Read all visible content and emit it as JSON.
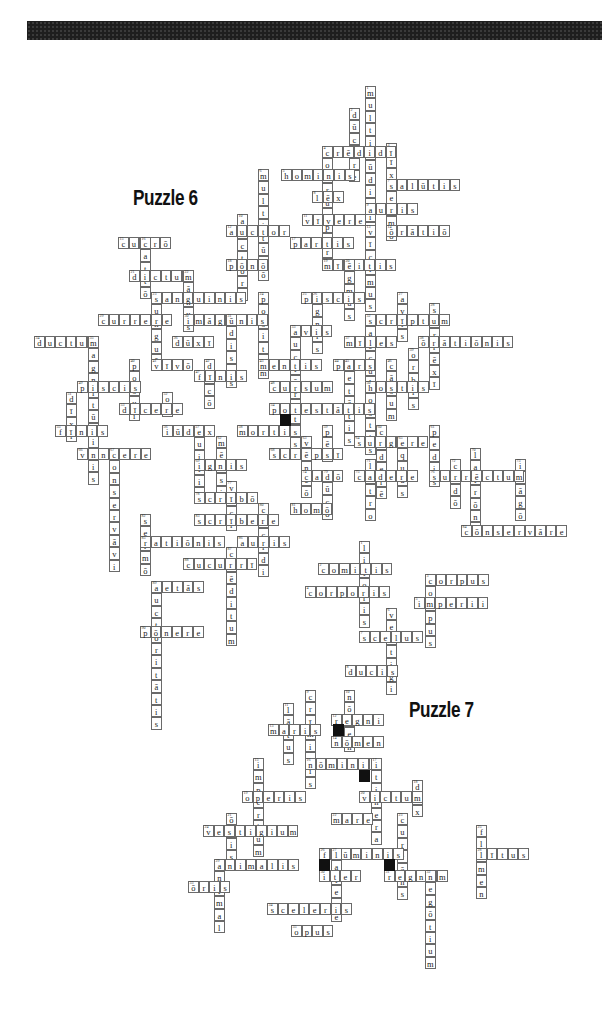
{
  "header": {
    "bar_color": "#1e1e1e"
  },
  "titles": [
    {
      "label": "Puzzle 6",
      "x": 133,
      "y": 185
    },
    {
      "label": "Puzzle 7",
      "x": 409,
      "y": 697
    }
  ],
  "cell": {
    "w": 10.6,
    "h": 12.4
  },
  "puzzle6": {
    "words": [
      {
        "n": "1",
        "x": 365,
        "y": 86,
        "dir": "down",
        "text": "multitūdinis"
      },
      {
        "n": "2",
        "x": 349,
        "y": 108,
        "dir": "down",
        "text": "dūcere"
      },
      {
        "n": "3",
        "x": 386,
        "y": 143,
        "dir": "down",
        "text": "vīxī"
      },
      {
        "n": "4",
        "x": 322,
        "y": 146,
        "dir": "across",
        "text": "crēdidī"
      },
      {
        "n": "4",
        "x": 322,
        "y": 146,
        "dir": "down",
        "text": "corrumpere"
      },
      {
        "n": "5",
        "x": 281,
        "y": 169,
        "dir": "across",
        "text": "hominis"
      },
      {
        "n": "6",
        "x": 258,
        "y": 169,
        "dir": "down",
        "text": "multitūdō"
      },
      {
        "n": "7",
        "x": 386,
        "y": 179,
        "dir": "across",
        "text": "salūtis"
      },
      {
        "n": "7",
        "x": 386,
        "y": 179,
        "dir": "down",
        "text": "sermō"
      },
      {
        "n": "8",
        "x": 312,
        "y": 191,
        "dir": "across",
        "text": "lēx"
      },
      {
        "n": "9",
        "x": 365,
        "y": 203,
        "dir": "across",
        "text": "auris"
      },
      {
        "n": "10",
        "x": 237,
        "y": 214,
        "dir": "down",
        "text": "auctōri"
      },
      {
        "n": "11",
        "x": 302,
        "y": 214,
        "dir": "across",
        "text": "vīvere"
      },
      {
        "n": "12",
        "x": 226,
        "y": 225,
        "dir": "across",
        "text": "auctor"
      },
      {
        "n": "13",
        "x": 365,
        "y": 225,
        "dir": "down",
        "text": "vīcimus"
      },
      {
        "n": "14",
        "x": 386,
        "y": 225,
        "dir": "across",
        "text": "ōrātiō"
      },
      {
        "n": "15",
        "x": 118,
        "y": 237,
        "dir": "across",
        "text": "currō"
      },
      {
        "n": "16",
        "x": 140,
        "y": 237,
        "dir": "down",
        "text": "cattō"
      },
      {
        "n": "17",
        "x": 290,
        "y": 237,
        "dir": "across",
        "text": "partis"
      },
      {
        "n": "18",
        "x": 226,
        "y": 259,
        "dir": "across",
        "text": "pōnō"
      },
      {
        "n": "19",
        "x": 322,
        "y": 259,
        "dir": "across",
        "text": "mīlitis"
      },
      {
        "n": "20",
        "x": 344,
        "y": 259,
        "dir": "down",
        "text": "ēgmus"
      },
      {
        "n": "21",
        "x": 129,
        "y": 270,
        "dir": "across",
        "text": "dictum"
      },
      {
        "n": "22",
        "x": 183,
        "y": 270,
        "dir": "down",
        "text": "mānus"
      },
      {
        "n": "23",
        "x": 151,
        "y": 292,
        "dir": "across",
        "text": "sanguinis"
      },
      {
        "n": "23",
        "x": 151,
        "y": 292,
        "dir": "down",
        "text": "sunguō"
      },
      {
        "n": "24",
        "x": 258,
        "y": 292,
        "dir": "down",
        "text": "positum"
      },
      {
        "n": "25",
        "x": 301,
        "y": 292,
        "dir": "across",
        "text": "piscis"
      },
      {
        "n": "26",
        "x": 312,
        "y": 292,
        "dir": "down",
        "text": "ignis"
      },
      {
        "n": "27",
        "x": 397,
        "y": 292,
        "dir": "down",
        "text": "avis"
      },
      {
        "n": "28",
        "x": 429,
        "y": 303,
        "dir": "down",
        "text": "surrēxī"
      },
      {
        "n": "29",
        "x": 98,
        "y": 314,
        "dir": "across",
        "text": "currere"
      },
      {
        "n": "30",
        "x": 183,
        "y": 314,
        "dir": "across",
        "text": "imāginis"
      },
      {
        "n": "31",
        "x": 226,
        "y": 314,
        "dir": "down",
        "text": "ūdiscs"
      },
      {
        "n": "32",
        "x": 365,
        "y": 314,
        "dir": "across",
        "text": "scrīptum"
      },
      {
        "n": "32",
        "x": 365,
        "y": 314,
        "dir": "down",
        "text": "saeculum"
      },
      {
        "n": "33",
        "x": 290,
        "y": 325,
        "dir": "across",
        "text": "avis"
      },
      {
        "n": "33",
        "x": 290,
        "y": 325,
        "dir": "down",
        "text": "auctōritās"
      },
      {
        "n": "34",
        "x": 34,
        "y": 336,
        "dir": "across",
        "text": "ductum"
      },
      {
        "n": "35",
        "x": 88,
        "y": 336,
        "dir": "down",
        "text": "magnitūdinis"
      },
      {
        "n": "36",
        "x": 172,
        "y": 336,
        "dir": "across",
        "text": "dūxī"
      },
      {
        "n": "37",
        "x": 344,
        "y": 336,
        "dir": "across",
        "text": "mīles"
      },
      {
        "n": "38",
        "x": 418,
        "y": 336,
        "dir": "across",
        "text": "ōrātiōnis"
      },
      {
        "n": "39",
        "x": 408,
        "y": 348,
        "dir": "down",
        "text": "orbis"
      },
      {
        "n": "40",
        "x": 129,
        "y": 359,
        "dir": "down",
        "text": "posui"
      },
      {
        "n": "41",
        "x": 151,
        "y": 359,
        "dir": "across",
        "text": "vīvō"
      },
      {
        "n": "42",
        "x": 204,
        "y": 359,
        "dir": "down",
        "text": "dīcō"
      },
      {
        "n": "43",
        "x": 258,
        "y": 359,
        "dir": "across",
        "text": "mentis"
      },
      {
        "n": "44",
        "x": 333,
        "y": 359,
        "dir": "across",
        "text": "pars"
      },
      {
        "n": "45",
        "x": 344,
        "y": 359,
        "dir": "down",
        "text": "aetātis"
      },
      {
        "n": "46",
        "x": 386,
        "y": 359,
        "dir": "down",
        "text": "cāsum"
      },
      {
        "n": "47",
        "x": 194,
        "y": 370,
        "dir": "across",
        "text": "fīnis"
      },
      {
        "n": "48",
        "x": 269,
        "y": 381,
        "dir": "across",
        "text": "cursum"
      },
      {
        "n": "49",
        "x": 77,
        "y": 381,
        "dir": "across",
        "text": "piscis"
      },
      {
        "n": "50",
        "x": 365,
        "y": 381,
        "dir": "across",
        "text": "hostis"
      },
      {
        "n": "50",
        "x": 365,
        "y": 381,
        "dir": "down",
        "text": "hostis"
      },
      {
        "n": "51",
        "x": 66,
        "y": 392,
        "dir": "down",
        "text": "dīxī"
      },
      {
        "n": "52",
        "x": 162,
        "y": 392,
        "dir": "down",
        "text": "ob"
      },
      {
        "n": "53",
        "x": 119,
        "y": 403,
        "dir": "across",
        "text": "dīcere"
      },
      {
        "n": "54",
        "x": 269,
        "y": 403,
        "dir": "across",
        "text": "potestātis"
      },
      {
        "n": "55",
        "x": 55,
        "y": 425,
        "dir": "across",
        "text": "fīnis"
      },
      {
        "n": "56",
        "x": 162,
        "y": 425,
        "dir": "across",
        "text": "iūdex"
      },
      {
        "n": "57",
        "x": 194,
        "y": 425,
        "dir": "down",
        "text": "quitis"
      },
      {
        "n": "58",
        "x": 237,
        "y": 425,
        "dir": "across",
        "text": "mortis"
      },
      {
        "n": "59",
        "x": 322,
        "y": 425,
        "dir": "down",
        "text": "pēs"
      },
      {
        "n": "60",
        "x": 376,
        "y": 425,
        "dir": "down",
        "text": "cēderē"
      },
      {
        "n": "61",
        "x": 429,
        "y": 425,
        "dir": "down",
        "text": "pedis"
      },
      {
        "n": "62",
        "x": 216,
        "y": 436,
        "dir": "down",
        "text": "mērsi"
      },
      {
        "n": "63",
        "x": 301,
        "y": 436,
        "dir": "down",
        "text": "vēncō"
      },
      {
        "n": "64",
        "x": 354,
        "y": 436,
        "dir": "across",
        "text": "surgere"
      },
      {
        "n": "65",
        "x": 397,
        "y": 436,
        "dir": "down",
        "text": "equus"
      },
      {
        "n": "66",
        "x": 77,
        "y": 448,
        "dir": "across",
        "text": "vincere"
      },
      {
        "n": "67",
        "x": 109,
        "y": 448,
        "dir": "down",
        "text": "conservāvi"
      },
      {
        "n": "68",
        "x": 269,
        "y": 448,
        "dir": "across",
        "text": "scrīpsī"
      },
      {
        "n": "69",
        "x": 194,
        "y": 459,
        "dir": "across",
        "text": "ignis"
      },
      {
        "n": "70",
        "x": 470,
        "y": 448,
        "dir": "down",
        "text": "latrōni"
      },
      {
        "n": "71",
        "x": 365,
        "y": 459,
        "dir": "down",
        "text": "latro"
      },
      {
        "n": "72",
        "x": 450,
        "y": 459,
        "dir": "down",
        "text": "cēdō"
      },
      {
        "n": "73",
        "x": 515,
        "y": 459,
        "dir": "down",
        "text": "imāgō"
      },
      {
        "n": "74",
        "x": 301,
        "y": 470,
        "dir": "across",
        "text": "cadō"
      },
      {
        "n": "75",
        "x": 354,
        "y": 470,
        "dir": "across",
        "text": "cadere"
      },
      {
        "n": "76",
        "x": 429,
        "y": 470,
        "dir": "across",
        "text": "surrēctum"
      },
      {
        "n": "77",
        "x": 226,
        "y": 481,
        "dir": "down",
        "text": "vīcī"
      },
      {
        "n": "78",
        "x": 194,
        "y": 492,
        "dir": "across",
        "text": "scrībō"
      },
      {
        "n": "79",
        "x": 322,
        "y": 470,
        "dir": "down",
        "text": "dūcō"
      },
      {
        "n": "80",
        "x": 258,
        "y": 503,
        "dir": "down",
        "text": "cecidi"
      },
      {
        "n": "81",
        "x": 290,
        "y": 503,
        "dir": "across",
        "text": "homō"
      },
      {
        "n": "82",
        "x": 140,
        "y": 514,
        "dir": "down",
        "text": "sermō"
      },
      {
        "n": "83",
        "x": 194,
        "y": 514,
        "dir": "across",
        "text": "scrībere"
      },
      {
        "n": "84",
        "x": 461,
        "y": 525,
        "dir": "across",
        "text": "cōnservāre"
      },
      {
        "n": "85",
        "x": 140,
        "y": 536,
        "dir": "across",
        "text": "ratiōnis"
      },
      {
        "n": "86",
        "x": 237,
        "y": 536,
        "dir": "across",
        "text": "auris"
      },
      {
        "n": "87",
        "x": 226,
        "y": 547,
        "dir": "down",
        "text": "crēditum"
      },
      {
        "n": "88",
        "x": 183,
        "y": 558,
        "dir": "across",
        "text": "cucurrī"
      },
      {
        "n": "89",
        "x": 151,
        "y": 581,
        "dir": "across",
        "text": "aetās"
      },
      {
        "n": "89",
        "x": 151,
        "y": 581,
        "dir": "down",
        "text": "auctōritātis"
      },
      {
        "n": "90",
        "x": 140,
        "y": 626,
        "dir": "across",
        "text": "pōnere"
      }
    ],
    "black_cells": [
      {
        "x": 280,
        "y": 414
      }
    ]
  },
  "puzzle7": {
    "words": [
      {
        "n": "1",
        "x": 359,
        "y": 541,
        "dir": "down",
        "text": "litoris"
      },
      {
        "n": "2",
        "x": 318,
        "y": 563,
        "dir": "across",
        "text": "comitis"
      },
      {
        "n": "3",
        "x": 425,
        "y": 574,
        "dir": "across",
        "text": "corpus"
      },
      {
        "n": "3",
        "x": 425,
        "y": 574,
        "dir": "down",
        "text": "corpus"
      },
      {
        "n": "4",
        "x": 305,
        "y": 586,
        "dir": "across",
        "text": "corporis"
      },
      {
        "n": "5",
        "x": 414,
        "y": 597,
        "dir": "across",
        "text": "imperii"
      },
      {
        "n": "6",
        "x": 386,
        "y": 608,
        "dir": "down",
        "text": "vestigi"
      },
      {
        "n": "7",
        "x": 359,
        "y": 631,
        "dir": "across",
        "text": "scelus"
      },
      {
        "n": "8",
        "x": 345,
        "y": 665,
        "dir": "across",
        "text": "ducis"
      },
      {
        "n": "9",
        "x": 305,
        "y": 690,
        "dir": "down",
        "text": "crīminis"
      },
      {
        "n": "10",
        "x": 344,
        "y": 690,
        "dir": "down",
        "text": "nōmen"
      },
      {
        "n": "11",
        "x": 283,
        "y": 703,
        "dir": "down",
        "text": "lātus"
      },
      {
        "n": "12",
        "x": 331,
        "y": 714,
        "dir": "across",
        "text": "regni"
      },
      {
        "n": "13",
        "x": 268,
        "y": 724,
        "dir": "across",
        "text": "maris"
      },
      {
        "n": "14",
        "x": 331,
        "y": 736,
        "dir": "across",
        "text": "nōmen"
      },
      {
        "n": "15",
        "x": 253,
        "y": 758,
        "dir": "down",
        "text": "imperium"
      },
      {
        "n": "16",
        "x": 305,
        "y": 758,
        "dir": "across",
        "text": "nōminis"
      },
      {
        "n": "17",
        "x": 371,
        "y": 758,
        "dir": "down",
        "text": "itinera"
      },
      {
        "n": "18",
        "x": 412,
        "y": 780,
        "dir": "down",
        "text": "dux"
      },
      {
        "n": "19",
        "x": 242,
        "y": 791,
        "dir": "across",
        "text": "operis"
      },
      {
        "n": "20",
        "x": 359,
        "y": 791,
        "dir": "across",
        "text": "victum"
      },
      {
        "n": "21",
        "x": 226,
        "y": 813,
        "dir": "down",
        "text": "ōris"
      },
      {
        "n": "22",
        "x": 331,
        "y": 813,
        "dir": "across",
        "text": "mare"
      },
      {
        "n": "23",
        "x": 397,
        "y": 813,
        "dir": "down",
        "text": "currēns"
      },
      {
        "n": "24",
        "x": 203,
        "y": 825,
        "dir": "across",
        "text": "vestigium"
      },
      {
        "n": "25",
        "x": 476,
        "y": 825,
        "dir": "down",
        "text": "flūmen"
      },
      {
        "n": "26",
        "x": 319,
        "y": 848,
        "dir": "across",
        "text": "flūminis"
      },
      {
        "n": "27",
        "x": 331,
        "y": 848,
        "dir": "down",
        "text": "latere"
      },
      {
        "n": "28",
        "x": 476,
        "y": 848,
        "dir": "across",
        "text": "lītus"
      },
      {
        "n": "29",
        "x": 214,
        "y": 859,
        "dir": "across",
        "text": "animalis"
      },
      {
        "n": "29",
        "x": 214,
        "y": 859,
        "dir": "down",
        "text": "animal"
      },
      {
        "n": "30",
        "x": 319,
        "y": 870,
        "dir": "across",
        "text": "iter"
      },
      {
        "n": "31",
        "x": 384,
        "y": 870,
        "dir": "across",
        "text": "regnum"
      },
      {
        "n": "32",
        "x": 425,
        "y": 870,
        "dir": "down",
        "text": "negōtium"
      },
      {
        "n": "33",
        "x": 188,
        "y": 881,
        "dir": "across",
        "text": "ōris"
      },
      {
        "n": "34",
        "x": 267,
        "y": 903,
        "dir": "across",
        "text": "sceleris"
      },
      {
        "n": "35",
        "x": 291,
        "y": 925,
        "dir": "across",
        "text": "opus"
      }
    ],
    "black_cells": [
      {
        "x": 333,
        "y": 724
      },
      {
        "x": 359,
        "y": 770
      },
      {
        "x": 319,
        "y": 859
      },
      {
        "x": 384,
        "y": 859
      }
    ]
  }
}
